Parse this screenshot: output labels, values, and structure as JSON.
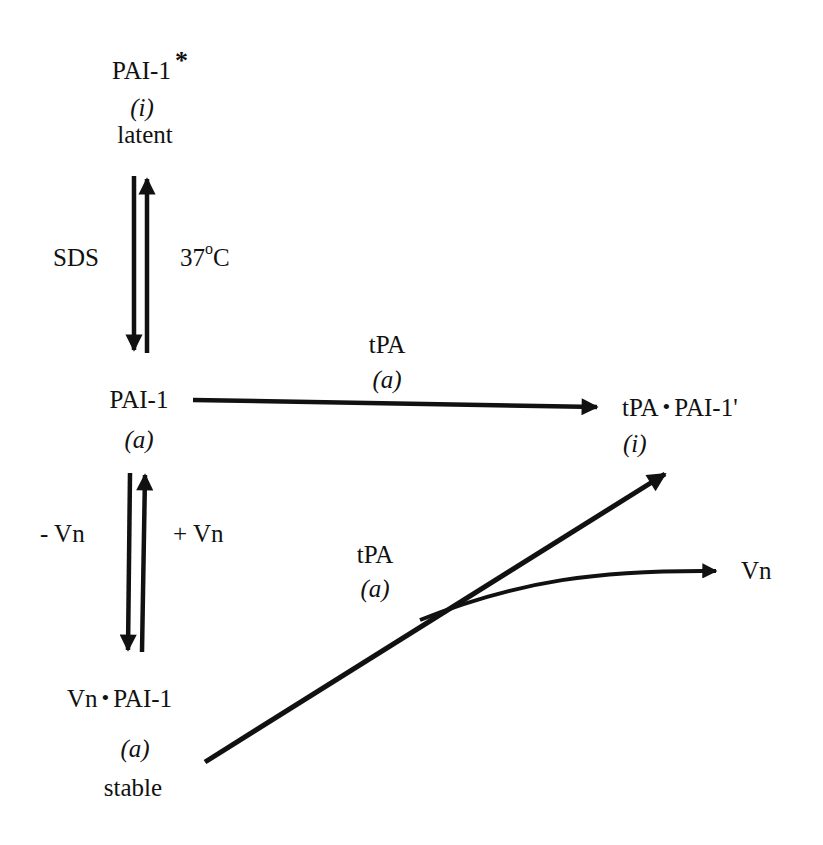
{
  "diagram": {
    "type": "reaction-scheme",
    "colors": {
      "ink": "#111111",
      "background": "#ffffff"
    },
    "nodes": {
      "latent": {
        "name": "PAI-1",
        "mark": "*",
        "state": "(i)",
        "descriptor": "latent"
      },
      "active": {
        "name": "PAI-1",
        "state": "(a)"
      },
      "complex": {
        "left": "tPA",
        "bullet": "•",
        "right": "PAI-1'",
        "state": "(i)"
      },
      "stable": {
        "left": "Vn",
        "bullet": "•",
        "right": "PAI-1",
        "state": "(a)",
        "descriptor": "stable"
      },
      "released": {
        "name": "Vn"
      }
    },
    "edges": {
      "sds": {
        "label": "SDS",
        "from": "latent",
        "to": "active"
      },
      "heat": {
        "label_value": "37",
        "label_degree": "o",
        "label_unit": "C",
        "from": "active",
        "to": "latent"
      },
      "tpa_top": {
        "label": "tPA",
        "state": "(a)",
        "from": "active",
        "to": "complex"
      },
      "minus_vn": {
        "label": "- Vn",
        "from": "active",
        "to": "stable"
      },
      "plus_vn": {
        "label": "+ Vn",
        "from": "stable",
        "to": "active"
      },
      "tpa_bottom": {
        "label": "tPA",
        "state": "(a)",
        "from": "stable",
        "to": "complex",
        "branch_to": "released"
      }
    }
  }
}
